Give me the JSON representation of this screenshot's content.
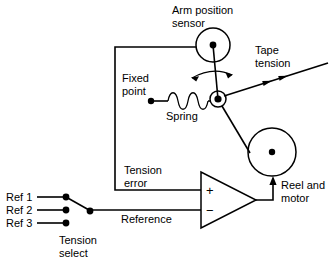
{
  "diagram": {
    "background_color": "#ffffff",
    "line_color": "#000000",
    "labels": {
      "arm_position_sensor": "Arm position\nsensor",
      "tape_tension": "Tape\ntension",
      "fixed_point": "Fixed\npoint",
      "spring": "Spring",
      "tension_error": "Tension\nerror",
      "reference": "Reference",
      "reel_and_motor": "Reel and\nmotor",
      "tension_select": "Tension\nselect",
      "ref_1": "Ref 1",
      "ref_2": "Ref 2",
      "ref_3": "Ref 3",
      "opamp_plus": "+",
      "opamp_minus": "−"
    },
    "components": [
      {
        "name": "arm-position-sensor",
        "type": "circle",
        "cx": 213,
        "cy": 45,
        "r": 17
      },
      {
        "name": "pivot",
        "type": "double-circle",
        "cx": 218,
        "cy": 99,
        "r_outer": 8,
        "r_inner": 4
      },
      {
        "name": "reel-and-motor",
        "type": "circle",
        "cx": 272,
        "cy": 152,
        "r": 24
      },
      {
        "name": "spring",
        "type": "coil",
        "coils": 4
      },
      {
        "name": "fixed-point",
        "type": "terminal-dot",
        "cx": 151,
        "cy": 101
      },
      {
        "name": "differential-amplifier",
        "type": "triangle"
      },
      {
        "name": "tension-select-switch",
        "type": "spdt-switch",
        "selected": "Ref 1"
      }
    ]
  }
}
